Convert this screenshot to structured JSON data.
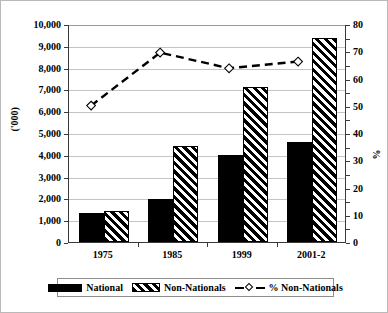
{
  "chart_data": {
    "type": "bar",
    "title": "",
    "xlabel": "",
    "ylabel": "('000)",
    "ylabel_secondary": "%",
    "categories": [
      "1975",
      "1985",
      "1999",
      "2001-2"
    ],
    "ylim": [
      0,
      10000
    ],
    "yticks": [
      "0",
      "1,000",
      "2,000",
      "3,000",
      "4,000",
      "5,000",
      "6,000",
      "7,000",
      "8,000",
      "9,000",
      "10,000"
    ],
    "ylim_secondary": [
      0,
      80
    ],
    "yticks_secondary": [
      "0",
      "10",
      "20",
      "30",
      "40",
      "50",
      "60",
      "70",
      "80"
    ],
    "grid": true,
    "legend_position": "bottom",
    "series": [
      {
        "name": "National",
        "type": "bar",
        "axis": "left",
        "values": [
          1350,
          1950,
          3980,
          4600
        ]
      },
      {
        "name": "Non-Nationals",
        "type": "bar",
        "axis": "left",
        "values": [
          1400,
          4400,
          7100,
          9350
        ]
      },
      {
        "name": "% Non-Nationals",
        "type": "line",
        "axis": "right",
        "marker": "diamond",
        "linestyle": "dashed",
        "values": [
          50.2,
          69.8,
          64.0,
          66.5
        ]
      }
    ]
  },
  "legend": {
    "items": [
      {
        "label": "National",
        "swatch": "solid-black-swatch"
      },
      {
        "label": "Non-Nationals",
        "swatch": "hatched-swatch"
      },
      {
        "label": "% Non-Nationals",
        "swatch": "dashed-line-diamond-marker"
      }
    ]
  }
}
